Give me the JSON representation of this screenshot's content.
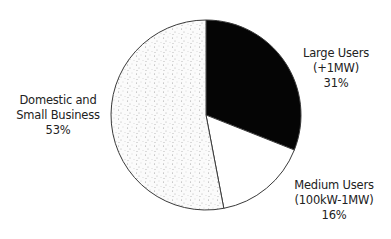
{
  "chart_data": {
    "type": "pie",
    "title": "",
    "slices": [
      {
        "label": "Large Users (+1MW)",
        "value": 31,
        "fill": "#050505"
      },
      {
        "label": "Medium Users (100kW-1MW)",
        "value": 16,
        "fill": "#ffffff"
      },
      {
        "label": "Domestic and Small Business",
        "value": 53,
        "fill": "stipple"
      }
    ],
    "categories": [
      "Large Users (+1MW)",
      "Medium Users (100kW-1MW)",
      "Domestic and Small Business"
    ],
    "values": [
      31,
      16,
      53
    ],
    "start_angle": "12 o'clock",
    "direction": "clockwise",
    "legend": "none (direct labels)"
  },
  "labels": {
    "large": {
      "line1": "Large Users",
      "line2": "(+1MW)",
      "pct": "31%"
    },
    "medium": {
      "line1": "Medium Users",
      "line2": "(100kW-1MW)",
      "pct": "16%"
    },
    "domestic": {
      "line1": "Domestic and",
      "line2": "Small Business",
      "pct": "53%"
    }
  },
  "colors": {
    "outline": "#3a3a3a",
    "large": "#050505",
    "medium": "#ffffff",
    "domestic_base": "#fbfbfb",
    "domestic_dots": "#9a9a9a"
  }
}
